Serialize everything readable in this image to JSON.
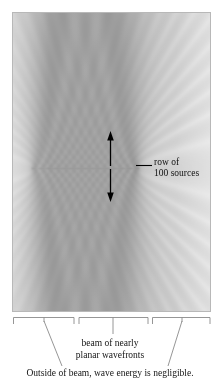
{
  "figure": {
    "panel": {
      "name": "wave-field-panel",
      "description": "grayscale wavefront interference pattern",
      "border_color": "#b8b8b8",
      "background_color": "#e9e9e9",
      "wave_color_dark": "#8f8f8f",
      "wave_color_light": "#f2f2f2"
    },
    "annotations": {
      "row_label_line1": "row of",
      "row_label_line2": "100 sources",
      "beam_caption_line1": "beam of nearly",
      "beam_caption_line2": "planar wavefronts",
      "outside_caption": "Outside of beam, wave energy is negligible."
    },
    "arrows": {
      "up_arrow_name": "propagation-arrow-up",
      "down_arrow_name": "propagation-arrow-down",
      "color": "#000000"
    },
    "leader_line_color": "#8a8a8a",
    "brace_color": "#8a8a8a",
    "source_row": {
      "count": 100,
      "y_center": 167,
      "x_start": 30,
      "x_end": 138
    }
  },
  "chart_data": {
    "type": "heatmap",
    "xlabel": "",
    "ylabel": "",
    "panel_extent_px": [
      12,
      12,
      211,
      312
    ],
    "source_count": 100,
    "source_row_y_px": 167,
    "source_row_x_extent_px": [
      30,
      138
    ],
    "wavelength_px": 7.6,
    "beam_x_extent_px": [
      79,
      148
    ],
    "grid": false,
    "legend": null,
    "colormap": "grayscale",
    "value_range": [
      0,
      1
    ]
  }
}
